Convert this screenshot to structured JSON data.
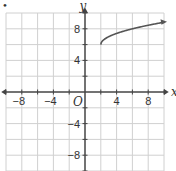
{
  "chart_data": {
    "type": "line",
    "title": "",
    "function": "y = sqrt(x - 2) + 6",
    "xlabel": "x",
    "ylabel": "y",
    "origin_label": "O",
    "xlim": [
      -10,
      10
    ],
    "ylim": [
      -10,
      10
    ],
    "grid": true,
    "grid_step": 2,
    "x_tick_labels": [
      "-8",
      "-4",
      "4",
      "8"
    ],
    "y_tick_labels": [
      "8",
      "4",
      "-4",
      "-8"
    ],
    "series": [
      {
        "name": "curve",
        "x": [
          2,
          2.25,
          3,
          4,
          5,
          6,
          7,
          8,
          9,
          10
        ],
        "y": [
          6,
          6.5,
          7,
          7.41,
          7.73,
          8,
          8.24,
          8.45,
          8.65,
          8.83
        ],
        "start_point": [
          2,
          6
        ],
        "arrow_end": true
      }
    ],
    "colors": {
      "curve": "#555555",
      "axis": "#444444",
      "grid": "#d0d0d0"
    }
  },
  "labels": {
    "bullet": "•"
  }
}
